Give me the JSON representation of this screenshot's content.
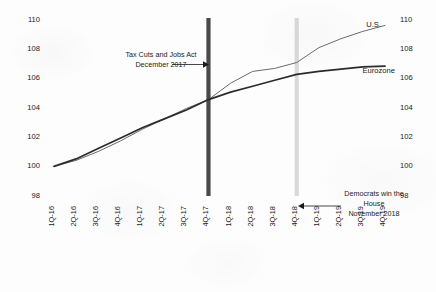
{
  "chart_data": {
    "type": "line",
    "title": "",
    "subtitle": "",
    "xlabel": "",
    "ylabel": "",
    "ylim": [
      98,
      110
    ],
    "ytick_step": 2,
    "yticks": [
      98,
      100,
      102,
      104,
      106,
      108,
      110
    ],
    "yticks_right": [
      98,
      100,
      102,
      104,
      106,
      108,
      110
    ],
    "grid": false,
    "legend_position": "inline-right-direct-labels",
    "index_base": "1Q-16 = 100",
    "categories": [
      "1Q-16",
      "2Q-16",
      "3Q-16",
      "4Q-16",
      "1Q-17",
      "2Q-17",
      "3Q-17",
      "4Q-17",
      "1Q-18",
      "2Q-18",
      "3Q-18",
      "4Q-18",
      "1Q-19",
      "2Q-19",
      "3Q-19",
      "4Q-19"
    ],
    "series": [
      {
        "name": "U.S.",
        "color": "#6b6b6b",
        "width": 1.0,
        "values": [
          100.0,
          100.4,
          101.0,
          101.7,
          102.5,
          103.2,
          103.9,
          104.5,
          105.6,
          106.4,
          106.6,
          107.0,
          108.0,
          108.6,
          109.1,
          109.5
        ]
      },
      {
        "name": "Eurozone",
        "color": "#2b2b2b",
        "width": 1.7,
        "values": [
          100.0,
          100.5,
          101.2,
          101.9,
          102.6,
          103.2,
          103.8,
          104.5,
          105.0,
          105.4,
          105.8,
          106.2,
          106.4,
          106.55,
          106.7,
          106.75
        ]
      }
    ],
    "events": [
      {
        "id": "tax-cuts-jobs-act",
        "at_category": "4Q-17",
        "color": "#4a4a4a",
        "style": "vertical-bar",
        "annotation_lines": [
          "Tax Cuts and Jobs Act",
          "December 2017"
        ],
        "arrow_direction": "right"
      },
      {
        "id": "democrats-win-house",
        "at_category": "4Q-18",
        "color": "#d9d9d9",
        "style": "vertical-bar",
        "annotation_lines": [
          "Democrats win the",
          "House",
          "November 2018"
        ],
        "arrow_direction": "left"
      }
    ]
  },
  "axis": {
    "left_ticks": [
      "110",
      "108",
      "106",
      "104",
      "102",
      "100",
      "98"
    ],
    "right_ticks": [
      "110",
      "108",
      "106",
      "104",
      "102",
      "100",
      "98"
    ],
    "x_ticks": [
      "1Q-16",
      "2Q-16",
      "3Q-16",
      "4Q-16",
      "1Q-17",
      "2Q-17",
      "3Q-17",
      "4Q-17",
      "1Q-18",
      "2Q-18",
      "3Q-18",
      "4Q-18",
      "1Q-19",
      "2Q-19",
      "3Q-19",
      "4Q-19"
    ]
  },
  "labels": {
    "series_us": "U.S.",
    "series_eurozone": "Eurozone",
    "event1_line1": "Tax Cuts and Jobs Act",
    "event1_line2": "December 2017",
    "event2_line1": "Democrats win the",
    "event2_line2": "House",
    "event2_line3": "November 2018"
  }
}
